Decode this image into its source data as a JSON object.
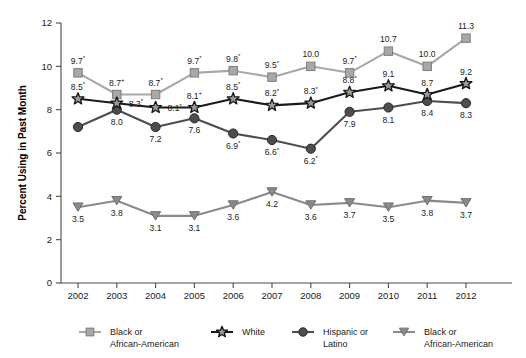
{
  "chart_data": {
    "type": "line",
    "title": "",
    "xlabel": "",
    "ylabel": "Percent Using in Past Month",
    "ylim": [
      0,
      12
    ],
    "yticks": [
      0,
      2,
      4,
      6,
      8,
      10,
      12
    ],
    "grid": false,
    "legend_position": "bottom",
    "categories": [
      "2002",
      "2003",
      "2004",
      "2005",
      "2006",
      "2007",
      "2008",
      "2009",
      "2010",
      "2011",
      "2012"
    ],
    "series": [
      {
        "name": "Black or African-American",
        "marker": "square",
        "color": "#a8a8a8",
        "values": [
          9.7,
          8.7,
          8.7,
          9.7,
          9.8,
          9.5,
          10.0,
          9.7,
          10.7,
          10.0,
          11.3
        ],
        "labels": [
          "9.7",
          "8.7",
          "8.7",
          "9.7",
          "9.8",
          "9.5",
          "10.0",
          "9.7",
          "10.7",
          "10.0",
          "11.3"
        ],
        "significance": [
          "*",
          "+",
          "*",
          "*",
          "*",
          "*",
          "",
          "*",
          "",
          "",
          ""
        ],
        "label_positions": [
          "above",
          "above",
          "above",
          "above",
          "above",
          "above",
          "above",
          "above",
          "above",
          "above",
          "above"
        ]
      },
      {
        "name": "White",
        "marker": "star",
        "color": "#1a1a1a",
        "values": [
          8.5,
          8.3,
          8.1,
          8.1,
          8.5,
          8.2,
          8.3,
          8.8,
          9.1,
          8.7,
          9.2
        ],
        "labels": [
          "8.5",
          "8.3",
          "8.1",
          "8.1",
          "8.5",
          "8.2",
          "8.3",
          "8.8",
          "9.1",
          "8.7",
          "9.2"
        ],
        "significance": [
          "*",
          "*",
          "*",
          "+",
          "*",
          "*",
          "*",
          "*",
          "",
          "",
          ""
        ],
        "label_positions": [
          "above",
          "right",
          "right",
          "above",
          "above",
          "above",
          "above",
          "above",
          "above",
          "above",
          "above"
        ]
      },
      {
        "name": "Hispanic or Latino",
        "marker": "circle",
        "color": "#4d4d4d",
        "values": [
          7.2,
          8.0,
          7.2,
          7.6,
          6.9,
          6.6,
          6.2,
          7.9,
          8.1,
          8.4,
          8.3
        ],
        "labels": [
          "",
          "8.0",
          "7.2",
          "7.6",
          "6.9",
          "6.6",
          "6.2",
          "7.9",
          "8.1",
          "8.4",
          "8.3"
        ],
        "significance": [
          "",
          "",
          "",
          "",
          "*",
          "*",
          "*",
          "",
          "",
          "",
          ""
        ],
        "label_positions": [
          "below",
          "below",
          "below",
          "below",
          "below",
          "below",
          "below",
          "below",
          "below",
          "below",
          "below"
        ]
      },
      {
        "name": "Black or African-American",
        "marker": "triangle-down",
        "color": "#8a8a8a",
        "values": [
          3.5,
          3.8,
          3.1,
          3.1,
          3.6,
          4.2,
          3.6,
          3.7,
          3.5,
          3.8,
          3.7
        ],
        "labels": [
          "3.5",
          "3.8",
          "3.1",
          "3.1",
          "3.6",
          "4.2",
          "3.6",
          "3.7",
          "3.5",
          "3.8",
          "3.7"
        ],
        "significance": [
          "",
          "",
          "",
          "",
          "",
          "",
          "",
          "",
          "",
          "",
          ""
        ],
        "label_positions": [
          "below",
          "below",
          "below",
          "below",
          "below",
          "below",
          "below",
          "below",
          "below",
          "below",
          "below"
        ]
      }
    ]
  },
  "axis": {
    "y_title": "Percent Using in Past Month",
    "y_tick_labels": [
      "0",
      "2",
      "4",
      "6",
      "8",
      "10",
      "12"
    ],
    "x_tick_labels": [
      "2002",
      "2003",
      "2004",
      "2005",
      "2006",
      "2007",
      "2008",
      "2009",
      "2010",
      "2011",
      "2012"
    ]
  },
  "legend": {
    "items": [
      {
        "label_line1": "Black or",
        "label_line2": "African-American",
        "marker": "square-marker-icon",
        "color": "#a8a8a8"
      },
      {
        "label_line1": "White",
        "label_line2": "",
        "marker": "star-marker-icon",
        "color": "#1a1a1a"
      },
      {
        "label_line1": "Hispanic or",
        "label_line2": "Latino",
        "marker": "circle-marker-icon",
        "color": "#4d4d4d"
      },
      {
        "label_line1": "Black or",
        "label_line2": "African-American",
        "marker": "triangle-marker-icon",
        "color": "#8a8a8a"
      }
    ]
  }
}
